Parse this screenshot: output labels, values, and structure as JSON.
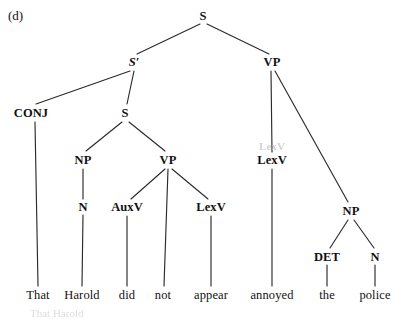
{
  "figure": {
    "panel_label": "(d)",
    "type": "syntax-tree",
    "sentence": "That Harold did not appear annoyed the police"
  },
  "colors": {
    "background": "#ffffff",
    "ink": "#111111",
    "edge": "#2b2b2b",
    "ghost": "#c2c2c2"
  },
  "nodes": [
    {
      "id": "S_root",
      "label": "S",
      "x": 203,
      "y": 16,
      "style": "cat"
    },
    {
      "id": "Sbar",
      "label": "S′",
      "x": 134,
      "y": 62,
      "style": "prime"
    },
    {
      "id": "VP_top",
      "label": "VP",
      "x": 272,
      "y": 62,
      "style": "cat"
    },
    {
      "id": "CONJ",
      "label": "CONJ",
      "x": 31,
      "y": 113,
      "style": "cat"
    },
    {
      "id": "S_emb",
      "label": "S",
      "x": 125,
      "y": 113,
      "style": "cat"
    },
    {
      "id": "NP_subj",
      "label": "NP",
      "x": 83,
      "y": 160,
      "style": "cat"
    },
    {
      "id": "VP_emb",
      "label": "VP",
      "x": 168,
      "y": 160,
      "style": "cat"
    },
    {
      "id": "LexV_mn",
      "label": "LexV",
      "x": 272,
      "y": 160,
      "style": "cat"
    },
    {
      "id": "N_subj",
      "label": "N",
      "x": 83,
      "y": 207,
      "style": "cat"
    },
    {
      "id": "AuxV",
      "label": "AuxV",
      "x": 127,
      "y": 207,
      "style": "cat"
    },
    {
      "id": "LexV_emb",
      "label": "LexV",
      "x": 211,
      "y": 207,
      "style": "cat"
    },
    {
      "id": "NP_obj",
      "label": "NP",
      "x": 351,
      "y": 211,
      "style": "cat"
    },
    {
      "id": "DET",
      "label": "DET",
      "x": 327,
      "y": 257,
      "style": "cat"
    },
    {
      "id": "N_obj",
      "label": "N",
      "x": 375,
      "y": 257,
      "style": "cat"
    }
  ],
  "ghost_nodes": [
    {
      "id": "LexV_ghost",
      "label": "LexV",
      "x": 272,
      "y": 146
    }
  ],
  "terminals": [
    {
      "id": "w_that",
      "label": "That",
      "x": 38,
      "y": 295,
      "parent": "CONJ"
    },
    {
      "id": "w_harold",
      "label": "Harold",
      "x": 82,
      "y": 295,
      "parent": "N_subj"
    },
    {
      "id": "w_did",
      "label": "did",
      "x": 127,
      "y": 295,
      "parent": "AuxV"
    },
    {
      "id": "w_not",
      "label": "not",
      "x": 163,
      "y": 295,
      "parent": "VP_emb"
    },
    {
      "id": "w_appear",
      "label": "appear",
      "x": 211,
      "y": 295,
      "parent": "LexV_emb"
    },
    {
      "id": "w_annoyed",
      "label": "annoyed",
      "x": 272,
      "y": 295,
      "parent": "LexV_mn"
    },
    {
      "id": "w_the",
      "label": "the",
      "x": 327,
      "y": 295,
      "parent": "DET"
    },
    {
      "id": "w_police",
      "label": "police",
      "x": 375,
      "y": 295,
      "parent": "N_obj"
    }
  ],
  "edges": [
    {
      "from": "S_root",
      "to": "Sbar",
      "x1": 200,
      "y1": 24,
      "x2": 137,
      "y2": 54
    },
    {
      "from": "S_root",
      "to": "VP_top",
      "x1": 207,
      "y1": 24,
      "x2": 269,
      "y2": 54
    },
    {
      "from": "Sbar",
      "to": "CONJ",
      "x1": 130,
      "y1": 71,
      "x2": 36,
      "y2": 104
    },
    {
      "from": "Sbar",
      "to": "S_emb",
      "x1": 134,
      "y1": 71,
      "x2": 127,
      "y2": 104
    },
    {
      "from": "S_emb",
      "to": "NP_subj",
      "x1": 122,
      "y1": 122,
      "x2": 86,
      "y2": 151
    },
    {
      "from": "S_emb",
      "to": "VP_emb",
      "x1": 129,
      "y1": 122,
      "x2": 165,
      "y2": 151
    },
    {
      "from": "NP_subj",
      "to": "N_subj",
      "x1": 83,
      "y1": 169,
      "x2": 83,
      "y2": 199
    },
    {
      "from": "VP_emb",
      "to": "AuxV",
      "x1": 165,
      "y1": 169,
      "x2": 131,
      "y2": 199
    },
    {
      "from": "VP_emb",
      "to": "not",
      "x1": 168,
      "y1": 169,
      "x2": 164,
      "y2": 286
    },
    {
      "from": "VP_emb",
      "to": "LexV_emb",
      "x1": 172,
      "y1": 169,
      "x2": 208,
      "y2": 199
    },
    {
      "from": "VP_top",
      "to": "LexV_mn",
      "x1": 271,
      "y1": 71,
      "x2": 272,
      "y2": 152
    },
    {
      "from": "VP_top",
      "to": "NP_obj",
      "x1": 275,
      "y1": 71,
      "x2": 348,
      "y2": 202
    },
    {
      "from": "NP_obj",
      "to": "DET",
      "x1": 348,
      "y1": 220,
      "x2": 330,
      "y2": 248
    },
    {
      "from": "NP_obj",
      "to": "N_obj",
      "x1": 354,
      "y1": 220,
      "x2": 374,
      "y2": 248
    },
    {
      "from": "CONJ",
      "to": "w_that",
      "x1": 35,
      "y1": 122,
      "x2": 38,
      "y2": 286
    },
    {
      "from": "N_subj",
      "to": "w_harold",
      "x1": 83,
      "y1": 215,
      "x2": 82,
      "y2": 286
    },
    {
      "from": "AuxV",
      "to": "w_did",
      "x1": 127,
      "y1": 216,
      "x2": 127,
      "y2": 286
    },
    {
      "from": "LexV_emb",
      "to": "w_appear",
      "x1": 211,
      "y1": 216,
      "x2": 211,
      "y2": 286
    },
    {
      "from": "LexV_mn",
      "to": "w_annoyed",
      "x1": 272,
      "y1": 169,
      "x2": 272,
      "y2": 286
    },
    {
      "from": "DET",
      "to": "w_the",
      "x1": 327,
      "y1": 265,
      "x2": 327,
      "y2": 286
    },
    {
      "from": "N_obj",
      "to": "w_police",
      "x1": 375,
      "y1": 265,
      "x2": 375,
      "y2": 286
    }
  ],
  "scan_artifacts": [
    {
      "id": "bottom-cut-text",
      "label": "That   Harold",
      "x": 30,
      "y": 307
    }
  ]
}
